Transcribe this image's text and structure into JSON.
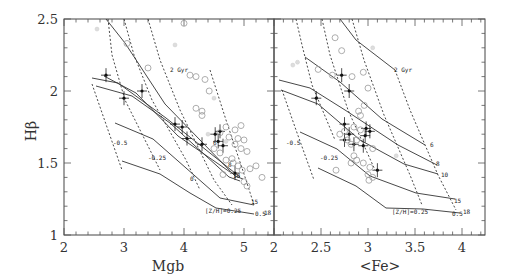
{
  "chart_data": [
    {
      "type": "scatter",
      "panel": "left",
      "xlabel": "Mgb",
      "ylabel": "Hβ",
      "xlim": [
        2,
        5.5
      ],
      "ylim": [
        1,
        2.5
      ],
      "xticks": [
        "2",
        "3",
        "4",
        "5"
      ],
      "yticks": [
        "1",
        "1.5",
        "2",
        "2.5"
      ],
      "grid": false,
      "model_grid": {
        "age_lines_labels": [
          "2 Gyr",
          "6",
          "8",
          "10",
          "15",
          "18"
        ],
        "metallicity_labels": [
          "-0.5",
          "-0.25",
          "0",
          "[Z/H]=0.25",
          "0.5"
        ]
      },
      "series": [
        {
          "name": "sample_with_errors",
          "marker": "filled-cross",
          "points": [
            [
              2.7,
              2.11
            ],
            [
              3.0,
              1.95
            ],
            [
              3.3,
              2.0
            ],
            [
              3.85,
              1.77
            ],
            [
              3.97,
              1.75
            ],
            [
              4.05,
              1.67
            ],
            [
              4.3,
              1.63
            ],
            [
              4.52,
              1.7
            ],
            [
              4.6,
              1.72
            ],
            [
              4.57,
              1.65
            ],
            [
              4.65,
              1.62
            ],
            [
              4.85,
              1.43
            ]
          ]
        },
        {
          "name": "comparison_open_circles",
          "marker": "open-circle",
          "points": [
            [
              4.0,
              2.47
            ],
            [
              3.05,
              2.33
            ],
            [
              3.4,
              2.16
            ],
            [
              4.1,
              2.11
            ],
            [
              4.2,
              2.1
            ],
            [
              4.35,
              2.08
            ],
            [
              4.42,
              2.0
            ],
            [
              4.2,
              1.88
            ],
            [
              4.3,
              1.86
            ],
            [
              4.3,
              1.83
            ],
            [
              4.7,
              1.75
            ],
            [
              4.95,
              1.76
            ],
            [
              4.85,
              1.73
            ],
            [
              4.6,
              1.71
            ],
            [
              4.75,
              1.68
            ],
            [
              4.9,
              1.67
            ],
            [
              5.0,
              1.66
            ],
            [
              4.85,
              1.63
            ],
            [
              4.95,
              1.6
            ],
            [
              5.05,
              1.58
            ],
            [
              4.5,
              1.6
            ],
            [
              4.6,
              1.57
            ],
            [
              4.7,
              1.52
            ],
            [
              4.82,
              1.5
            ],
            [
              4.9,
              1.48
            ],
            [
              4.97,
              1.45
            ],
            [
              5.1,
              1.46
            ],
            [
              5.3,
              1.4
            ],
            [
              4.65,
              1.42
            ],
            [
              5.0,
              1.37
            ],
            [
              5.05,
              1.34
            ],
            [
              4.8,
              1.53
            ],
            [
              5.2,
              1.48
            ]
          ]
        },
        {
          "name": "comparison_grey",
          "marker": "light-triangle",
          "points": [
            [
              2.55,
              2.43
            ],
            [
              3.85,
              2.32
            ],
            [
              4.5,
              1.95
            ],
            [
              4.7,
              1.65
            ],
            [
              4.4,
              1.7
            ]
          ]
        }
      ]
    },
    {
      "type": "scatter",
      "panel": "right",
      "xlabel": "<Fe>",
      "ylabel": "Hβ",
      "xlim": [
        2,
        4.25
      ],
      "ylim": [
        1,
        2.5
      ],
      "xticks": [
        "2",
        "2.5",
        "3",
        "3.5",
        "4"
      ],
      "grid": false,
      "model_grid": {
        "age_lines_labels": [
          "2 Gyr",
          "6",
          "8",
          "10",
          "15",
          "18"
        ],
        "metallicity_labels": [
          "-0.5",
          "-0.25",
          "[Z/H]=0.25",
          "0.5"
        ]
      },
      "series": [
        {
          "name": "sample_with_errors",
          "marker": "filled-cross",
          "points": [
            [
              2.72,
              2.11
            ],
            [
              2.8,
              2.0
            ],
            [
              2.45,
              1.95
            ],
            [
              2.75,
              1.77
            ],
            [
              2.98,
              1.74
            ],
            [
              3.02,
              1.72
            ],
            [
              2.97,
              1.69
            ],
            [
              2.75,
              1.66
            ],
            [
              2.85,
              1.63
            ],
            [
              2.95,
              1.62
            ],
            [
              2.8,
              1.7
            ],
            [
              3.1,
              1.45
            ]
          ]
        },
        {
          "name": "comparison_open_circles",
          "marker": "open-circle",
          "points": [
            [
              2.65,
              2.37
            ],
            [
              2.72,
              2.28
            ],
            [
              2.47,
              2.15
            ],
            [
              2.62,
              2.11
            ],
            [
              2.95,
              2.13
            ],
            [
              2.83,
              2.1
            ],
            [
              3.0,
              2.02
            ],
            [
              2.96,
              1.9
            ],
            [
              2.9,
              1.86
            ],
            [
              2.92,
              1.83
            ],
            [
              2.85,
              1.75
            ],
            [
              2.92,
              1.73
            ],
            [
              2.75,
              1.72
            ],
            [
              2.7,
              1.7
            ],
            [
              2.78,
              1.66
            ],
            [
              2.88,
              1.66
            ],
            [
              2.82,
              1.63
            ],
            [
              3.05,
              1.6
            ],
            [
              2.85,
              1.55
            ],
            [
              2.88,
              1.52
            ],
            [
              2.82,
              1.5
            ],
            [
              2.95,
              1.5
            ],
            [
              2.66,
              1.45
            ],
            [
              3.0,
              1.42
            ],
            [
              3.05,
              1.4
            ],
            [
              3.01,
              1.38
            ],
            [
              3.02,
              1.47
            ]
          ]
        },
        {
          "name": "comparison_grey",
          "marker": "light-triangle",
          "points": [
            [
              2.25,
              2.2
            ],
            [
              2.2,
              2.18
            ],
            [
              3.05,
              2.3
            ],
            [
              3.3,
              1.55
            ]
          ]
        }
      ]
    }
  ],
  "labels": {
    "ylabel": "Hβ",
    "left_xlabel": "Mgb",
    "right_xlabel": "<Fe>",
    "left_xticks": [
      "2",
      "3",
      "4",
      "5"
    ],
    "right_xticks": [
      "2",
      "2.5",
      "3",
      "3.5",
      "4"
    ],
    "yticks": [
      "1",
      "1.5",
      "2",
      "2.5"
    ],
    "left_annot": {
      "gyr2": "2 Gyr",
      "m05": "-0.5",
      "m025": "-0.25",
      "z0": "0",
      "zh": "[Z/H]=0.25",
      "z05": "0.5",
      "a6": "6",
      "a8": "8",
      "a10": "10",
      "a15": "15",
      "a18": "18"
    },
    "right_annot": {
      "gyr2": "2 Gyr",
      "m05": "-0.5",
      "m025": "-0.25",
      "zh": "[Z/H]=0.25",
      "z05": "0.5",
      "a6": "6",
      "a8": "8",
      "a10": "10",
      "a15": "15",
      "a18": "18"
    }
  }
}
